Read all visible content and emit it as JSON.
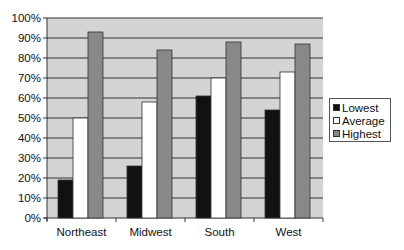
{
  "chart_data": {
    "type": "bar",
    "title": "",
    "xlabel": "",
    "ylabel": "",
    "categories": [
      "Northeast",
      "Midwest",
      "South",
      "West"
    ],
    "series": [
      {
        "name": "Lowest",
        "color": "#111111",
        "values": [
          19,
          26,
          61,
          54
        ]
      },
      {
        "name": "Average",
        "color": "#ffffff",
        "values": [
          50,
          58,
          70,
          73
        ]
      },
      {
        "name": "Highest",
        "color": "#888888",
        "values": [
          93,
          84,
          88,
          87
        ]
      }
    ],
    "ylim": [
      0,
      100
    ],
    "yticks": [
      "0%",
      "10%",
      "20%",
      "30%",
      "40%",
      "50%",
      "60%",
      "70%",
      "80%",
      "90%",
      "100%"
    ],
    "grid": true,
    "plot_background": "#d4d4d4",
    "legend_position": "right"
  },
  "legend": {
    "items": [
      {
        "label": "Lowest",
        "color": "#111111"
      },
      {
        "label": "Average",
        "color": "#ffffff"
      },
      {
        "label": "Highest",
        "color": "#888888"
      }
    ]
  }
}
